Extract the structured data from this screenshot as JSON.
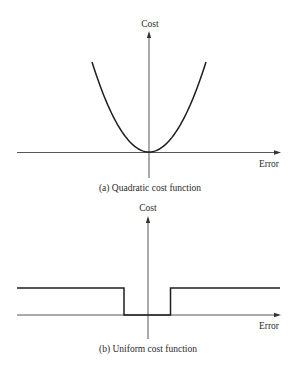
{
  "figure": {
    "panels": [
      {
        "id": "a",
        "caption": "(a)  Quadratic cost function",
        "y_label": "Cost",
        "x_label": "Error",
        "function": "quadratic",
        "description": "C(e) = e^2"
      },
      {
        "id": "b",
        "caption": "(b)  Uniform cost function",
        "y_label": "Cost",
        "x_label": "Error",
        "function": "uniform",
        "description": "C(e) = 0 for |e| < Δ/2, 1 otherwise"
      }
    ]
  },
  "chart_data": [
    {
      "type": "line",
      "title": "(a)  Quadratic cost function",
      "xlabel": "Error",
      "ylabel": "Cost",
      "x": [
        -1,
        -0.75,
        -0.5,
        -0.25,
        0,
        0.25,
        0.5,
        0.75,
        1
      ],
      "values": [
        1,
        0.5625,
        0.25,
        0.0625,
        0,
        0.0625,
        0.25,
        0.5625,
        1
      ],
      "grid": false
    },
    {
      "type": "line",
      "title": "(b)  Uniform cost function",
      "xlabel": "Error",
      "ylabel": "Cost",
      "x": [
        -1,
        -0.18,
        -0.18,
        0.18,
        0.18,
        1
      ],
      "values": [
        1,
        1,
        0,
        0,
        1,
        1
      ],
      "grid": false
    }
  ]
}
